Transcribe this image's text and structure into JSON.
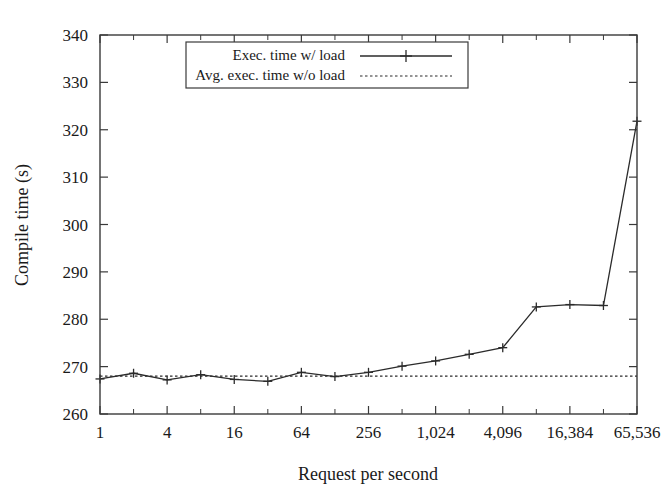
{
  "chart_data": {
    "type": "line",
    "title": "",
    "xlabel": "Request per second",
    "ylabel": "Compile time (s)",
    "xscale": "log2",
    "xlim": [
      1,
      65536
    ],
    "ylim": [
      260,
      340
    ],
    "yticks": [
      260,
      270,
      280,
      290,
      300,
      310,
      320,
      330,
      340
    ],
    "ytick_labels": [
      "260",
      "270",
      "280",
      "290",
      "300",
      "310",
      "320",
      "330",
      "340"
    ],
    "xticks": [
      1,
      4,
      16,
      64,
      256,
      1024,
      4096,
      16384,
      65536
    ],
    "xtick_labels": [
      "1",
      "4",
      "16",
      "64",
      "256",
      "1,024",
      "4,096",
      "16,384",
      "65,536"
    ],
    "x_minor_ticks": [
      2,
      8,
      32,
      128,
      512,
      2048,
      8192,
      32768
    ],
    "grid": false,
    "legend_position": "top-center",
    "series": [
      {
        "name": "Exec. time w/ load",
        "style": "solid-with-cross-markers",
        "x": [
          1,
          2,
          4,
          8,
          16,
          32,
          64,
          128,
          256,
          512,
          1024,
          2048,
          4096,
          8192,
          16384,
          32768,
          65536
        ],
        "values": [
          267.4,
          268.6,
          267.2,
          268.3,
          267.3,
          266.9,
          268.8,
          267.9,
          268.8,
          270.1,
          271.2,
          272.6,
          274.0,
          282.6,
          283.1,
          282.9,
          325.6
        ],
        "last_value_note": "321.8"
      },
      {
        "name": "Avg. exec. time w/o load",
        "style": "dotted-horizontal",
        "constant_value": 268.0,
        "x": [
          1,
          65536
        ],
        "values": [
          268.0,
          268.0
        ]
      }
    ],
    "series_fix": {
      "note": "final point of series 1",
      "x": 65536,
      "value": 321.8
    }
  },
  "legend": {
    "items": [
      {
        "label": "Exec. time w/ load",
        "marker": "line-cross"
      },
      {
        "label": "Avg. exec. time w/o load",
        "marker": "dotted"
      }
    ]
  },
  "colors": {
    "line": "#2b2b2b",
    "frame": "#3a3a3a",
    "background": "#ffffff"
  }
}
